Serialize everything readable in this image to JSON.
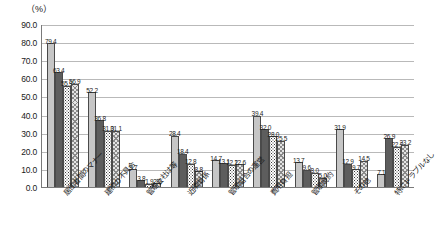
{
  "chart_data": {
    "type": "bar",
    "title": "",
    "subtitle": "",
    "unit_label": "（%）",
    "xlabel": "",
    "ylabel": "",
    "ylim": [
      0.0,
      90.0
    ],
    "grid": true,
    "legend_position": "none",
    "ytick_labels": [
      "90.0",
      "80.0",
      "70.0",
      "60.0",
      "50.0",
      "40.0",
      "30.0",
      "20.0",
      "10.0",
      "0.0"
    ],
    "ytick_values": [
      90.0,
      80.0,
      70.0,
      60.0,
      50.0,
      40.0,
      30.0,
      20.0,
      10.0,
      0.0
    ],
    "categories": [
      "居住者間のマナー",
      "建物の不具合",
      "管理会社は等",
      "近隣関係",
      "管理組合の運営",
      "費用負担",
      "管理規約",
      "その他",
      "特にトラブルなし"
    ],
    "series": [
      {
        "name": "series-1",
        "pattern": "solid-light-gray",
        "color": "#c6c6c6",
        "values": [
          79.4,
          52.2,
          9.7,
          28.4,
          14.7,
          39.4,
          13.7,
          31.9,
          7.1
        ]
      },
      {
        "name": "series-2",
        "pattern": "solid-dark-gray",
        "color": "#5d5d5d",
        "values": [
          63.4,
          36.8,
          3.8,
          18.4,
          13.1,
          32.0,
          9.6,
          12.9,
          26.9
        ]
      },
      {
        "name": "series-3",
        "pattern": "dotted",
        "color": "#ffffff",
        "values": [
          55.9,
          31.0,
          1.9,
          12.8,
          12.2,
          28.0,
          8.0,
          9.7,
          22.3
        ]
      },
      {
        "name": "series-4",
        "pattern": "cross-hatch",
        "color": "#e4e4e4",
        "values": [
          56.9,
          31.1,
          2.0,
          8.8,
          12.6,
          25.5,
          5.0,
          14.5,
          23.2
        ]
      }
    ]
  }
}
